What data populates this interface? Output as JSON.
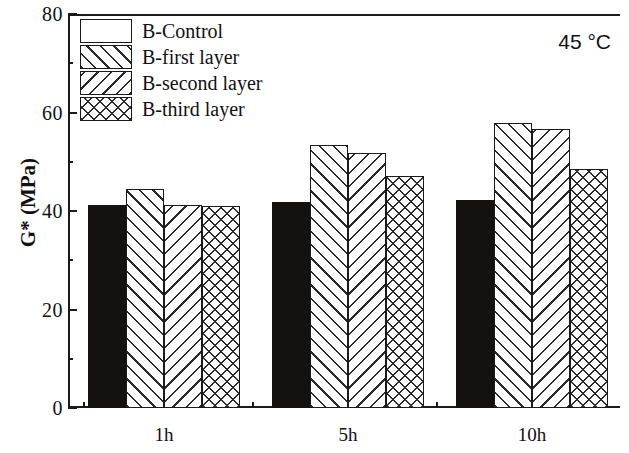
{
  "chart_data": {
    "type": "bar",
    "title": "",
    "xlabel": "",
    "ylabel": "G* (MPa)",
    "categories": [
      "1h",
      "5h",
      "10h"
    ],
    "series": [
      {
        "name": "B-Control",
        "pattern": "solid",
        "values": [
          41.2,
          41.8,
          42.2
        ]
      },
      {
        "name": "B-first layer",
        "pattern": "fslash",
        "values": [
          44.5,
          53.3,
          57.8
        ]
      },
      {
        "name": "B-second layer",
        "pattern": "bslash",
        "values": [
          41.3,
          51.8,
          56.7
        ]
      },
      {
        "name": "B-third layer",
        "pattern": "cross",
        "values": [
          41.0,
          47.2,
          48.6
        ]
      }
    ],
    "ylim": [
      0,
      80
    ],
    "ytick_major": [
      0,
      20,
      40,
      60,
      80
    ],
    "ytick_minor": [
      10,
      30,
      50,
      70
    ],
    "grid": false,
    "legend_position": "top-left",
    "annotation": "45 °C"
  },
  "axes": {
    "y_title": "G* (MPa)",
    "y_labels": [
      "0",
      "20",
      "40",
      "60",
      "80"
    ],
    "x_labels": [
      "1h",
      "5h",
      "10h"
    ]
  },
  "legend": {
    "items": [
      {
        "label": "B-Control"
      },
      {
        "label": "B-first layer"
      },
      {
        "label": "B-second layer"
      },
      {
        "label": "B-third layer"
      }
    ]
  },
  "annotation": {
    "temperature": "45 °C"
  }
}
